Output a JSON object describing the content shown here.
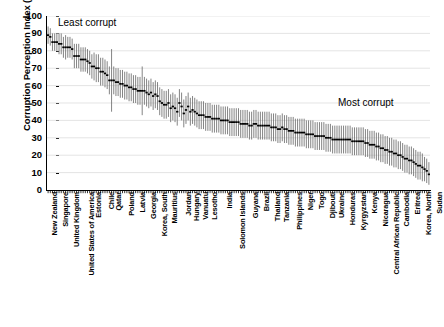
{
  "chart_data": {
    "type": "bar",
    "title": "",
    "subtitle": "",
    "xlabel": "",
    "ylabel": "Corruption Perception Index (2017)",
    "ylim": [
      0,
      100
    ],
    "yticks": [
      0,
      10,
      20,
      30,
      40,
      50,
      60,
      70,
      80,
      90,
      100
    ],
    "grid": true,
    "legend": null,
    "annotations": [
      {
        "text": "Least corrupt",
        "x_frac": 0.03,
        "y_value": 98
      },
      {
        "text": "Most corrupt",
        "x_frac": 0.76,
        "y_value": 53
      }
    ],
    "series_description": "Each country is plotted as a vertical error bar (range of source assessments) with a thick dark horizontal marker at the mean Corruption Perception Index score. Countries are ordered from least corrupt (highest index) on the left to most corrupt (lowest index) on the right.",
    "categories": [
      "New Zealand",
      "Denmark",
      "Finland",
      "Norway",
      "Switzerland",
      "Singapore",
      "Sweden",
      "Canada",
      "Luxembourg",
      "Netherlands",
      "United Kingdom",
      "Germany",
      "Australia",
      "Hong Kong",
      "Iceland",
      "Austria",
      "Belgium",
      "United States of America",
      "Ireland",
      "Japan",
      "Estonia",
      "United Arab Emirates",
      "France",
      "Uruguay",
      "Barbados",
      "Bhutan",
      "Chile",
      "Bahamas",
      "Portugal",
      "Qatar",
      "Taiwan",
      "Brunei",
      "Israel",
      "Botswana",
      "Slovenia",
      "Poland",
      "Seychelles",
      "Costa Rica",
      "Lithuania",
      "Saint Vincent",
      "Latvia",
      "Cyprus",
      "Czech Republic",
      "Dominica",
      "Spain",
      "Georgia",
      "Cape Verde",
      "Malta",
      "Mauritius",
      "Rwanda",
      "Korea, South",
      "Namibia",
      "Slovakia",
      "Croatia",
      "Saudi Arabia",
      "Mauritius",
      "Malaysia",
      "Romania",
      "Cuba",
      "Hungary",
      "Italy",
      "Jordan",
      "Oman",
      "Sao Tome",
      "Greece",
      "Hungary",
      "Montenegro",
      "Senegal",
      "Belarus",
      "Vanuatu",
      "South Africa",
      "Bahrain",
      "Burkina Faso",
      "Lesotho",
      "Tunisia",
      "China",
      "Serbia",
      "Suriname",
      "Trinidad",
      "Ghana",
      "India",
      "Morocco",
      "Turkey",
      "Argentina",
      "Benin",
      "Kosovo",
      "Solomon Islands",
      "Albania",
      "Bosnia",
      "Jamaica",
      "Mongolia",
      "Panama",
      "Guyana",
      "Indonesia",
      "Sri Lanka",
      "Swaziland",
      "Gambia",
      "Brazil",
      "Colombia",
      "Zambia",
      "Peru",
      "Thailand",
      "Timor-Leste",
      "Bulgaria",
      "Tunisia",
      "Tanzania",
      "Armenia",
      "Cote d'Ivoire",
      "Egypt",
      "El Salvador",
      "Philippines",
      "Algeria",
      "Bolivia",
      "Ecuador",
      "Niger",
      "Vietnam",
      "Pakistan",
      "Mali",
      "Togo",
      "Malawi",
      "Moldova",
      "Azerbaijan",
      "Djibouti",
      "Gabon",
      "Liberia",
      "Ukraine",
      "Guinea",
      "Kazakhstan",
      "Maldives",
      "Honduras",
      "Laos",
      "Mexico",
      "Papua New Guinea",
      "Kyrgyzstan",
      "Paraguay",
      "Russia",
      "Dominican Republic",
      "Kenya",
      "Lebanon",
      "Mauritania",
      "Myanmar",
      "Nepal",
      "Nicaragua",
      "Nigeria",
      "Guatemala",
      "Iran",
      "Uganda",
      "Central African Republic",
      "Comoros",
      "Madagascar",
      "Bangladesh",
      "Cambodia",
      "Chad",
      "Haiti",
      "Zimbabwe",
      "Congo",
      "Eritrea",
      "Tajikistan",
      "Turkmenistan",
      "Burundi",
      "Korea, North",
      "Equatorial Guinea",
      "Guinea-Bissau",
      "Libya",
      "Venezuela",
      "Iraq",
      "Yemen",
      "Sudan",
      "Afghanistan",
      "Syria",
      "South Sudan",
      "Somalia"
    ],
    "labeled_ticks": [
      {
        "index": 0,
        "label": "New Zealand"
      },
      {
        "index": 5,
        "label": "Singapore"
      },
      {
        "index": 10,
        "label": "United Kingdom"
      },
      {
        "index": 17,
        "label": "United States of America"
      },
      {
        "index": 20,
        "label": "Estonia"
      },
      {
        "index": 26,
        "label": "Chile"
      },
      {
        "index": 29,
        "label": "Qatar"
      },
      {
        "index": 35,
        "label": "Poland"
      },
      {
        "index": 40,
        "label": "Latvia"
      },
      {
        "index": 45,
        "label": "Georgia"
      },
      {
        "index": 50,
        "label": "Korea, South"
      },
      {
        "index": 55,
        "label": "Mauritius"
      },
      {
        "index": 61,
        "label": "Jordan"
      },
      {
        "index": 65,
        "label": "Hungary"
      },
      {
        "index": 69,
        "label": "Vanuatu"
      },
      {
        "index": 73,
        "label": "Lesotho"
      },
      {
        "index": 80,
        "label": "India"
      },
      {
        "index": 86,
        "label": "Solomon Islands"
      },
      {
        "index": 92,
        "label": "Guyana"
      },
      {
        "index": 97,
        "label": "Brazil"
      },
      {
        "index": 102,
        "label": "Thailand"
      },
      {
        "index": 106,
        "label": "Tanzania"
      },
      {
        "index": 112,
        "label": "Philippines"
      },
      {
        "index": 117,
        "label": "Niger"
      },
      {
        "index": 122,
        "label": "Togo"
      },
      {
        "index": 127,
        "label": "Djibouti"
      },
      {
        "index": 131,
        "label": "Ukraine"
      },
      {
        "index": 136,
        "label": "Honduras"
      },
      {
        "index": 141,
        "label": "Kyrgyzstan"
      },
      {
        "index": 146,
        "label": "Kenya"
      },
      {
        "index": 151,
        "label": "Nicaragua"
      },
      {
        "index": 156,
        "label": "Central African Republic"
      },
      {
        "index": 161,
        "label": "Cambodia"
      },
      {
        "index": 166,
        "label": "Eritrea"
      },
      {
        "index": 171,
        "label": "Korea, North"
      },
      {
        "index": 176,
        "label": "Sudan"
      }
    ],
    "means": [
      89,
      88,
      85,
      85,
      85,
      84,
      84,
      82,
      82,
      82,
      82,
      81,
      77,
      77,
      77,
      75,
      75,
      75,
      74,
      73,
      71,
      71,
      70,
      70,
      68,
      68,
      67,
      66,
      63,
      63,
      63,
      62,
      62,
      61,
      61,
      60,
      60,
      59,
      59,
      58,
      58,
      57,
      57,
      57,
      57,
      56,
      55,
      56,
      54,
      55,
      54,
      51,
      50,
      49,
      49,
      50,
      47,
      48,
      47,
      45,
      50,
      48,
      44,
      46,
      48,
      45,
      46,
      45,
      44,
      43,
      43,
      43,
      42,
      42,
      42,
      41,
      41,
      41,
      41,
      40,
      40,
      40,
      40,
      39,
      39,
      39,
      39,
      39,
      38,
      38,
      38,
      38,
      37,
      37,
      38,
      38,
      37,
      37,
      37,
      37,
      37,
      37,
      36,
      36,
      36,
      35,
      35,
      36,
      35,
      35,
      34,
      34,
      34,
      33,
      33,
      33,
      33,
      33,
      32,
      32,
      32,
      32,
      31,
      31,
      31,
      31,
      31,
      30,
      30,
      30,
      29,
      29,
      29,
      29,
      29,
      29,
      29,
      29,
      29,
      28,
      28,
      28,
      28,
      28,
      28,
      27,
      27,
      26,
      26,
      26,
      25,
      25,
      24,
      24,
      23,
      23,
      22,
      22,
      21,
      21,
      20,
      20,
      19,
      18,
      18,
      17,
      17,
      16,
      15,
      14,
      14,
      13,
      12,
      11,
      9
    ],
    "error_low": [
      84,
      83,
      80,
      80,
      80,
      78,
      78,
      76,
      75,
      76,
      76,
      75,
      70,
      70,
      70,
      68,
      68,
      68,
      67,
      66,
      64,
      63,
      62,
      62,
      60,
      60,
      59,
      58,
      55,
      45,
      55,
      54,
      54,
      53,
      53,
      52,
      52,
      51,
      51,
      50,
      50,
      49,
      49,
      43,
      49,
      48,
      47,
      48,
      46,
      47,
      46,
      43,
      42,
      41,
      41,
      42,
      39,
      40,
      39,
      37,
      42,
      40,
      36,
      38,
      40,
      37,
      38,
      37,
      36,
      35,
      35,
      35,
      34,
      34,
      34,
      33,
      33,
      33,
      33,
      32,
      32,
      32,
      32,
      31,
      31,
      31,
      31,
      31,
      30,
      30,
      30,
      30,
      29,
      29,
      30,
      30,
      29,
      29,
      29,
      29,
      29,
      29,
      28,
      28,
      28,
      27,
      27,
      28,
      27,
      27,
      26,
      26,
      26,
      25,
      25,
      25,
      25,
      25,
      24,
      24,
      24,
      24,
      23,
      23,
      23,
      23,
      23,
      22,
      22,
      22,
      21,
      21,
      21,
      21,
      21,
      21,
      21,
      21,
      21,
      20,
      20,
      20,
      20,
      20,
      20,
      19,
      19,
      18,
      18,
      18,
      17,
      17,
      16,
      16,
      15,
      15,
      14,
      14,
      13,
      13,
      12,
      12,
      11,
      10,
      10,
      9,
      9,
      8,
      7,
      6,
      6,
      5,
      5,
      4,
      3
    ],
    "error_high": [
      94,
      93,
      90,
      90,
      90,
      90,
      90,
      88,
      89,
      88,
      88,
      87,
      84,
      84,
      84,
      82,
      82,
      82,
      81,
      80,
      78,
      79,
      78,
      78,
      76,
      76,
      75,
      74,
      71,
      81,
      71,
      70,
      70,
      69,
      69,
      68,
      68,
      67,
      67,
      66,
      66,
      65,
      65,
      71,
      65,
      64,
      63,
      64,
      62,
      63,
      62,
      59,
      58,
      57,
      57,
      58,
      55,
      56,
      55,
      53,
      58,
      56,
      52,
      54,
      56,
      53,
      54,
      53,
      52,
      51,
      51,
      51,
      50,
      50,
      50,
      49,
      49,
      49,
      49,
      48,
      48,
      48,
      48,
      47,
      47,
      47,
      47,
      47,
      46,
      46,
      46,
      46,
      45,
      45,
      46,
      46,
      45,
      45,
      45,
      45,
      45,
      45,
      44,
      44,
      44,
      43,
      43,
      44,
      43,
      43,
      42,
      42,
      42,
      41,
      41,
      41,
      41,
      41,
      40,
      40,
      40,
      40,
      39,
      39,
      39,
      39,
      39,
      38,
      38,
      38,
      37,
      37,
      37,
      37,
      37,
      37,
      37,
      37,
      37,
      36,
      36,
      36,
      36,
      36,
      36,
      35,
      35,
      34,
      34,
      34,
      33,
      33,
      32,
      32,
      31,
      31,
      30,
      30,
      29,
      29,
      28,
      28,
      27,
      26,
      26,
      25,
      25,
      24,
      23,
      22,
      22,
      21,
      19,
      18,
      16
    ],
    "colors": {
      "error_bar": "#6e6e6e",
      "mean_marker": "#000000",
      "grid": "#d9d9d9",
      "axis": "#000000",
      "background": "#ffffff"
    }
  }
}
